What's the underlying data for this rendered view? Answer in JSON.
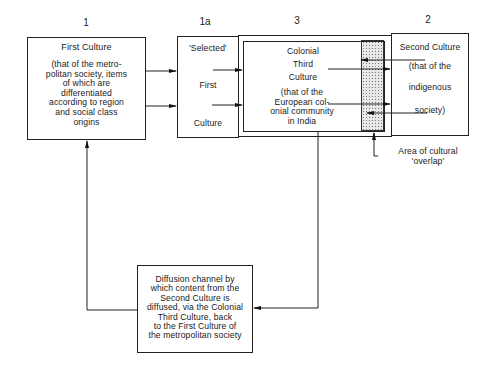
{
  "diagram": {
    "labels": {
      "n1": "1",
      "n1a": "1a",
      "n3": "3",
      "n2": "2"
    },
    "first_culture": {
      "title": "First Culture",
      "description_lines": [
        "(that of the metro-",
        "politan society, items",
        "of which are",
        "differentiated",
        "according to region",
        "and social class",
        "origins"
      ]
    },
    "selected_first_culture": {
      "line1": "'Selected'",
      "line2": "First",
      "line3": "Culture"
    },
    "colonial_third_culture": {
      "title_lines": [
        "Colonial",
        "Third",
        "Culture"
      ],
      "description_lines": [
        "(that of the",
        "European col-",
        "onial community",
        "in India"
      ]
    },
    "second_culture": {
      "title": "Second Culture",
      "description_lines": [
        "(that of the",
        "indigenous",
        "society)"
      ]
    },
    "overlap_annotation": {
      "lines": [
        "Area of cultural",
        "'overlap'"
      ]
    },
    "diffusion_channel": {
      "lines": [
        "Diffusion channel by",
        "which content from the",
        "Second Culture is",
        "diffused, via the Colonial",
        "Third Culture, back",
        "to the First Culture of",
        "the metropolitan society"
      ]
    }
  }
}
